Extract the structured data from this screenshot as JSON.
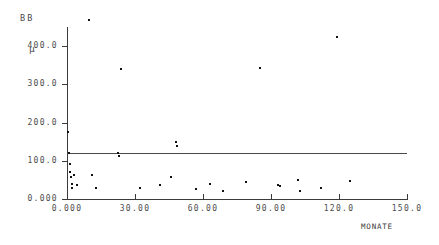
{
  "chart_data": {
    "type": "scatter",
    "title": "",
    "subtitle": "",
    "ylabel": "BB",
    "yunit": "µ",
    "xlabel": "MONATE",
    "xlim": [
      0,
      150
    ],
    "ylim": [
      0,
      450
    ],
    "grid": false,
    "legend": null,
    "xticks": [
      0,
      30,
      60,
      90,
      120,
      150
    ],
    "xticklabels": [
      "0.000",
      "30.00",
      "60.00",
      "90.00",
      "120.0",
      "150.0"
    ],
    "yticks": [
      0,
      100,
      200,
      300,
      400
    ],
    "yticklabels": [
      "0.000",
      "100.0",
      "200.0",
      "300.0",
      "400.0"
    ],
    "reference_line": {
      "type": "horizontal",
      "y": 120,
      "label": ""
    },
    "points": [
      {
        "x": 0.5,
        "y": 175
      },
      {
        "x": 1.0,
        "y": 120
      },
      {
        "x": 1.2,
        "y": 92
      },
      {
        "x": 1.5,
        "y": 70
      },
      {
        "x": 1.8,
        "y": 58
      },
      {
        "x": 2.0,
        "y": 40
      },
      {
        "x": 2.4,
        "y": 30
      },
      {
        "x": 3.0,
        "y": 63
      },
      {
        "x": 4.5,
        "y": 37
      },
      {
        "x": 9.5,
        "y": 468
      },
      {
        "x": 11.0,
        "y": 62
      },
      {
        "x": 13.0,
        "y": 30
      },
      {
        "x": 22.5,
        "y": 120
      },
      {
        "x": 23.0,
        "y": 112
      },
      {
        "x": 24.0,
        "y": 340
      },
      {
        "x": 32.0,
        "y": 28
      },
      {
        "x": 41.0,
        "y": 36
      },
      {
        "x": 46.0,
        "y": 57
      },
      {
        "x": 48.0,
        "y": 148
      },
      {
        "x": 48.5,
        "y": 138
      },
      {
        "x": 57.0,
        "y": 26
      },
      {
        "x": 63.0,
        "y": 40
      },
      {
        "x": 69.0,
        "y": 22
      },
      {
        "x": 79.0,
        "y": 45
      },
      {
        "x": 85.0,
        "y": 342
      },
      {
        "x": 93.0,
        "y": 37
      },
      {
        "x": 94.0,
        "y": 33
      },
      {
        "x": 102.0,
        "y": 50
      },
      {
        "x": 103.0,
        "y": 22
      },
      {
        "x": 112.0,
        "y": 28
      },
      {
        "x": 119.0,
        "y": 425
      },
      {
        "x": 125.0,
        "y": 46
      }
    ]
  }
}
